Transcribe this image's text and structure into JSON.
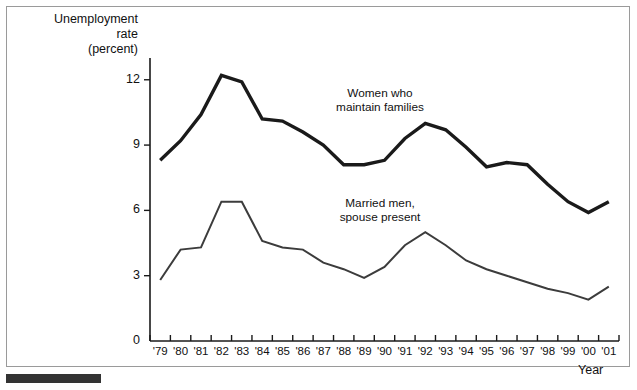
{
  "chart_data": {
    "type": "line",
    "title": "",
    "ylabel": "Unemployment\nrate\n(percent)",
    "xlabel": "Year",
    "ylim": [
      0,
      13
    ],
    "yticks": [
      0,
      3,
      6,
      9,
      12
    ],
    "ytick_labels": [
      "0",
      "3",
      "6",
      "9",
      "12"
    ],
    "grid": false,
    "legend_position": "inline-annotation",
    "categories": [
      "'79",
      "'80",
      "'81",
      "'82",
      "'83",
      "'84",
      "'85",
      "'86",
      "'87",
      "'88",
      "'89",
      "'90",
      "'91",
      "'92",
      "'93",
      "'94",
      "'95",
      "'96",
      "'97",
      "'98",
      "'99",
      "'00",
      "'01"
    ],
    "x": [
      1979,
      1980,
      1981,
      1982,
      1983,
      1984,
      1985,
      1986,
      1987,
      1988,
      1989,
      1990,
      1991,
      1992,
      1993,
      1994,
      1995,
      1996,
      1997,
      1998,
      1999,
      2000,
      2001
    ],
    "series": [
      {
        "name": "Women who maintain families",
        "color": "#1a1a1a",
        "line_width": 3.4,
        "values": [
          8.3,
          9.2,
          10.4,
          12.2,
          11.9,
          10.2,
          10.1,
          9.6,
          9.0,
          8.1,
          8.1,
          8.3,
          9.3,
          10.0,
          9.7,
          8.9,
          8.0,
          8.2,
          8.1,
          7.2,
          6.4,
          5.9,
          6.4
        ]
      },
      {
        "name": "Married men, spouse present",
        "color": "#3c3c3c",
        "line_width": 2.0,
        "values": [
          2.8,
          4.2,
          4.3,
          6.4,
          6.4,
          4.6,
          4.3,
          4.2,
          3.6,
          3.3,
          2.9,
          3.4,
          4.4,
          5.0,
          4.4,
          3.7,
          3.3,
          3.0,
          2.7,
          2.4,
          2.2,
          1.9,
          2.5
        ]
      }
    ],
    "annotations": [
      {
        "text": "Women who\nmaintain families",
        "series": "Women who maintain families"
      },
      {
        "text": "Married men,\nspouse present",
        "series": "Married men, spouse present"
      }
    ]
  }
}
